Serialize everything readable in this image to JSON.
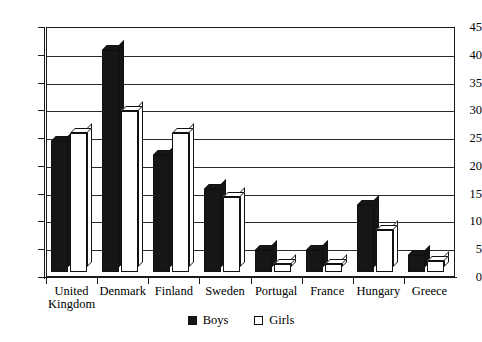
{
  "chart_data": {
    "type": "bar",
    "title": "",
    "xlabel": "",
    "ylabel": "",
    "ylim": [
      0,
      45
    ],
    "ytick_step": 5,
    "yticks": [
      0,
      5,
      10,
      15,
      20,
      25,
      30,
      35,
      40,
      45
    ],
    "grid": true,
    "legend_position": "bottom-center",
    "categories": [
      "United\nKingdom",
      "Denmark",
      "Finland",
      "Sweden",
      "Portugal",
      "France",
      "Hungary",
      "Greece"
    ],
    "series": [
      {
        "name": "Boys",
        "color": "#161616",
        "values": [
          23.5,
          40,
          21,
          15,
          4,
          4,
          12,
          3
        ]
      },
      {
        "name": "Girls",
        "color": "#ffffff",
        "values": [
          25,
          29,
          25,
          13.5,
          1.5,
          1.5,
          7.5,
          2
        ]
      }
    ]
  },
  "legend": {
    "items": [
      {
        "label": "Boys",
        "swatch": "filled-square-icon"
      },
      {
        "label": "Girls",
        "swatch": "outline-square-icon"
      }
    ]
  }
}
